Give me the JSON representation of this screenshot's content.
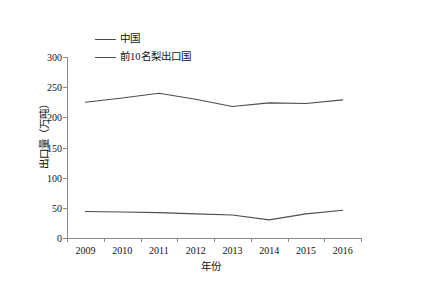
{
  "chart_data": {
    "type": "line",
    "title": "",
    "xlabel": "年份",
    "ylabel": "出口量（万吨）",
    "categories": [
      "2009",
      "2010",
      "2011",
      "2012",
      "2013",
      "2014",
      "2015",
      "2016"
    ],
    "series": [
      {
        "name": "中国",
        "values": [
          44,
          43,
          42,
          40,
          38,
          30,
          40,
          46
        ],
        "color": "#4d4d4d"
      },
      {
        "name": "前10名梨出口国",
        "values": [
          225,
          232,
          240,
          230,
          218,
          224,
          223,
          229
        ],
        "color": "#4d4d4d"
      }
    ],
    "ylim": [
      0,
      300
    ],
    "yticks": [
      0,
      50,
      100,
      150,
      200,
      250,
      300
    ],
    "grid": false,
    "legend_position": "top-center",
    "legend_entries": [
      "中国",
      "前10名梨出口国"
    ]
  }
}
